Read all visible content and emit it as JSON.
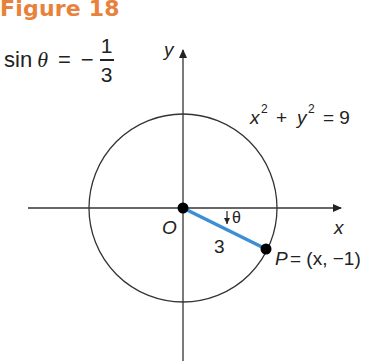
{
  "figure": {
    "title": "Figure 18",
    "title_color": "#e8823a",
    "given": {
      "lhs_func": "sin",
      "lhs_var": "θ",
      "equals": "=",
      "sign": "−",
      "numerator": "1",
      "denominator": "3"
    },
    "labels": {
      "y_axis": "y",
      "x_axis": "x",
      "origin": "O",
      "circle_equation_x": "x",
      "circle_equation_plus": "+",
      "circle_equation_y": "y",
      "circle_equation_exp": "2",
      "circle_equation_rhs": "= 9",
      "angle": "θ",
      "radius": "3",
      "point_name": "P",
      "point_coords": "= (x, −1)"
    },
    "colors": {
      "radius_segment": "#3a8fd6",
      "axes": "#333333",
      "circle": "#333333",
      "points": "#000000"
    },
    "geometry": {
      "circle_radius": 3,
      "point_P_y": -1
    }
  }
}
